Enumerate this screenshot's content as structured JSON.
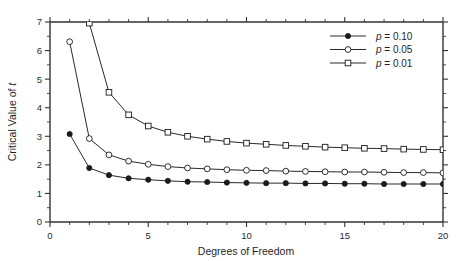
{
  "chart_data": {
    "type": "line",
    "title": "",
    "xlabel": "Degrees of Freedom",
    "ylabel": "Critical Value of t",
    "xlim": [
      0,
      20
    ],
    "ylim": [
      0,
      7
    ],
    "xticks": [
      0,
      5,
      10,
      15,
      20
    ],
    "xtick_labels": [
      "0",
      "5",
      "10",
      "15",
      "20"
    ],
    "x_minor_step": 1,
    "yticks": [
      0,
      1,
      2,
      3,
      4,
      5,
      6,
      7
    ],
    "ytick_labels": [
      "0",
      "1",
      "2",
      "3",
      "4",
      "5",
      "6",
      "7"
    ],
    "y_minor_step": 0.5,
    "grid": false,
    "legend_position": "top-right",
    "x": [
      1,
      2,
      3,
      4,
      5,
      6,
      7,
      8,
      9,
      10,
      11,
      12,
      13,
      14,
      15,
      16,
      17,
      18,
      19,
      20
    ],
    "series": [
      {
        "name": "p = 0.10",
        "marker": "filled-circle",
        "values": [
          3.08,
          1.89,
          1.64,
          1.53,
          1.48,
          1.44,
          1.41,
          1.4,
          1.38,
          1.37,
          1.36,
          1.36,
          1.35,
          1.35,
          1.34,
          1.34,
          1.33,
          1.33,
          1.33,
          1.33
        ]
      },
      {
        "name": "p = 0.05",
        "marker": "open-circle",
        "values": [
          6.31,
          2.92,
          2.35,
          2.13,
          2.02,
          1.94,
          1.89,
          1.86,
          1.83,
          1.81,
          1.8,
          1.78,
          1.77,
          1.76,
          1.75,
          1.75,
          1.74,
          1.73,
          1.73,
          1.72
        ]
      },
      {
        "name": "p = 0.01",
        "marker": "open-square",
        "values": [
          63.66,
          6.96,
          4.54,
          3.75,
          3.36,
          3.14,
          3.0,
          2.9,
          2.82,
          2.76,
          2.72,
          2.68,
          2.65,
          2.62,
          2.6,
          2.58,
          2.57,
          2.55,
          2.54,
          2.53
        ]
      }
    ]
  },
  "axes": {
    "y_label_prefix": "Critical Value of ",
    "y_label_italic": "t",
    "x_label": "Degrees of Freedom"
  },
  "legend": {
    "entries": [
      {
        "prefix": "p",
        "equals": "=",
        "value": "0.10",
        "marker": "filled-circle"
      },
      {
        "prefix": "p",
        "equals": "=",
        "value": "0.05",
        "marker": "open-circle"
      },
      {
        "prefix": "p",
        "equals": "=",
        "value": "0.01",
        "marker": "open-square"
      }
    ]
  },
  "colors": {
    "line": "#2a2a2a",
    "axis": "#333333",
    "marker_fill": "#1a1a1a",
    "marker_open_fill": "#ffffff",
    "background": "#ffffff"
  }
}
